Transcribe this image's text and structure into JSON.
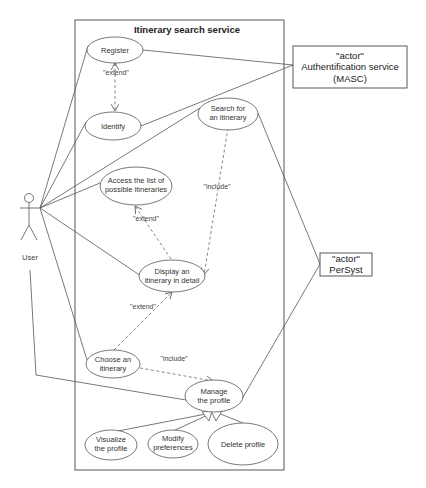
{
  "system": {
    "title": "Itinerary search service"
  },
  "actors": {
    "user": {
      "label": "User"
    },
    "auth": {
      "stereotype": "\"actor\"",
      "name": "Authentification service",
      "subname": "(MASC)"
    },
    "persyst": {
      "stereotype": "\"actor\"",
      "name": "PerSyst"
    }
  },
  "use_cases": {
    "register": {
      "line1": "Register"
    },
    "identify": {
      "line1": "Identify"
    },
    "search": {
      "line1": "Search for",
      "line2": "an itinerary"
    },
    "access_list": {
      "line1": "Access the list of",
      "line2": "possible itineraries"
    },
    "display": {
      "line1": "Display an",
      "line2": "itinerary in detail"
    },
    "choose": {
      "line1": "Choose an",
      "line2": "itinerary"
    },
    "manage": {
      "line1": "Manage",
      "line2": "the profile"
    },
    "visualize": {
      "line1": "Visualize",
      "line2": "the profile"
    },
    "modify": {
      "line1": "Modify",
      "line2": "preferences"
    },
    "delete": {
      "line1": "Delete profile"
    }
  },
  "relations": {
    "register_identify": "\"extend\"",
    "search_display": "\"include\"",
    "display_access": "\"extend\"",
    "choose_display": "\"extend\"",
    "choose_manage": "\"include\""
  }
}
